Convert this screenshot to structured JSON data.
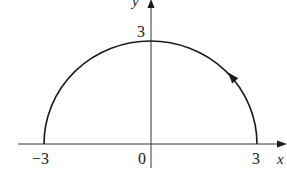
{
  "diagram": {
    "type": "parametric-curve",
    "axes": {
      "x_label": "x",
      "y_label": "y",
      "origin_label": "0"
    },
    "tick_labels": {
      "x_neg": "−3",
      "x_pos": "3",
      "y_pos": "3"
    },
    "curve": {
      "shape": "semicircle",
      "radius": 3,
      "start": [
        3,
        0
      ],
      "end": [
        -3,
        0
      ],
      "direction": "counterclockwise",
      "arrow_marker": "up-left arrow on right side of arc"
    },
    "colors": {
      "stroke": "#1a1a1a",
      "axis": "#333333",
      "background": "#ffffff"
    }
  }
}
